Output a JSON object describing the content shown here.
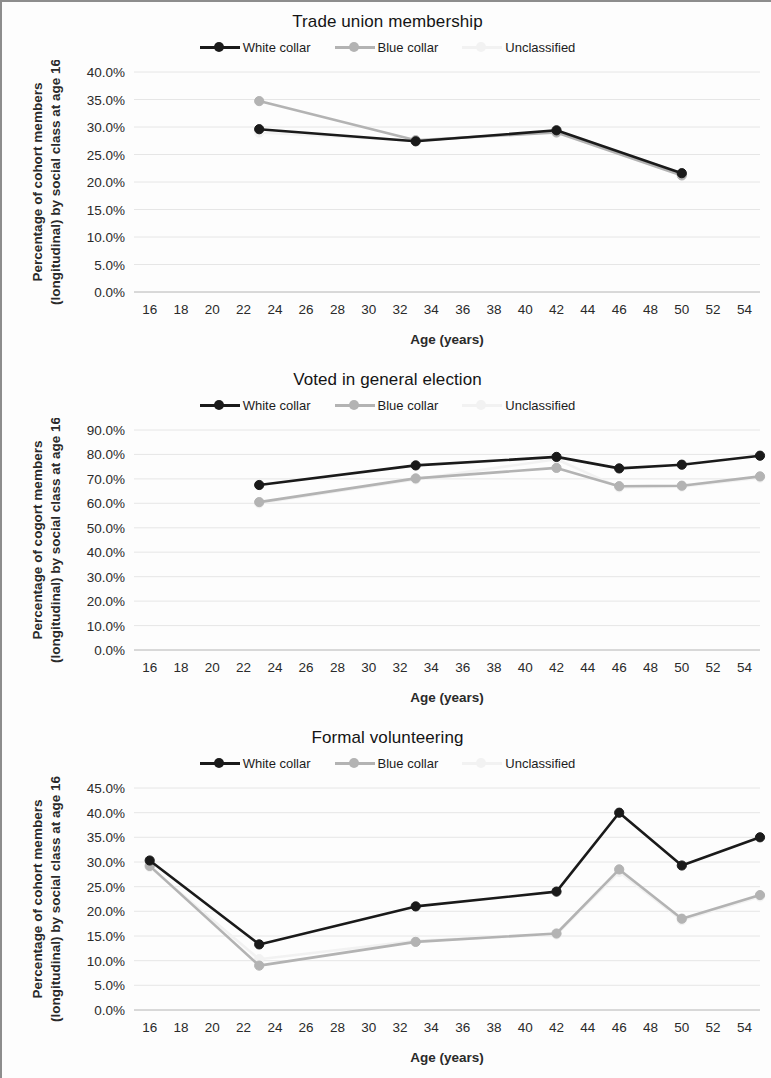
{
  "figure": {
    "axis_x_label": "Age (years)",
    "series_colors": {
      "white_collar": "#1a1a1a",
      "blue_collar": "#b3b3b3",
      "unclassified": "#f2f2f2"
    },
    "gridline_color": "#e6e6e6",
    "axis_line_color": "#bfbfbf"
  },
  "charts": [
    {
      "title": "Trade union membership",
      "ylabel_line1": "Percentage of cohort members",
      "ylabel_line2": "(longitudinal) by social class at age 16",
      "xlabel": "Age (years)",
      "legend": [
        {
          "label": "White collar",
          "color": "#1a1a1a",
          "marker": true
        },
        {
          "label": "Blue collar",
          "color": "#b3b3b3",
          "marker": true
        },
        {
          "label": "Unclassified",
          "color": "#f2f2f2",
          "marker": true
        }
      ],
      "chart_data": {
        "type": "line",
        "title": "Trade union membership",
        "xlabel": "Age (years)",
        "ylabel": "Percentage of cohort members (longitudinal) by social class at age 16",
        "xlim": [
          15,
          55
        ],
        "ylim": [
          0,
          40
        ],
        "xticks": [
          16,
          18,
          20,
          22,
          24,
          26,
          28,
          30,
          32,
          34,
          36,
          38,
          40,
          42,
          44,
          46,
          48,
          50,
          52,
          54
        ],
        "yticks": [
          0,
          5,
          10,
          15,
          20,
          25,
          30,
          35,
          40
        ],
        "ytick_labels": [
          "0.0%",
          "5.0%",
          "10.0%",
          "15.0%",
          "20.0%",
          "25.0%",
          "30.0%",
          "35.0%",
          "40.0%"
        ],
        "grid": true,
        "legend_position": "top",
        "series": [
          {
            "name": "White collar",
            "color": "#1a1a1a",
            "x": [
              23,
              33,
              42,
              50
            ],
            "values": [
              29.6,
              27.4,
              29.4,
              21.6
            ]
          },
          {
            "name": "Blue collar",
            "color": "#b3b3b3",
            "x": [
              23,
              33,
              42,
              50
            ],
            "values": [
              34.7,
              27.6,
              29.0,
              21.2
            ]
          },
          {
            "name": "Unclassified",
            "color": "#f2f2f2",
            "x": [
              23,
              33,
              42,
              50
            ],
            "values": [
              29.0,
              27.5,
              29.2,
              21.4
            ]
          }
        ]
      }
    },
    {
      "title": "Voted in general election",
      "ylabel_line1": "Percentage of cogort members",
      "ylabel_line2": "(longitudinal) by social class at age 16",
      "xlabel": "Age (years)",
      "legend": [
        {
          "label": "White collar",
          "color": "#1a1a1a",
          "marker": true
        },
        {
          "label": "Blue collar",
          "color": "#b3b3b3",
          "marker": true
        },
        {
          "label": "Unclassified",
          "color": "#f2f2f2",
          "marker": true
        }
      ],
      "chart_data": {
        "type": "line",
        "title": "Voted in general election",
        "xlabel": "Age (years)",
        "ylabel": "Percentage of cogort members (longitudinal) by social class at age 16",
        "xlim": [
          15,
          55
        ],
        "ylim": [
          0,
          90
        ],
        "xticks": [
          16,
          18,
          20,
          22,
          24,
          26,
          28,
          30,
          32,
          34,
          36,
          38,
          40,
          42,
          44,
          46,
          48,
          50,
          52,
          54
        ],
        "yticks": [
          0,
          10,
          20,
          30,
          40,
          50,
          60,
          70,
          80,
          90
        ],
        "ytick_labels": [
          "0.0%",
          "10.0%",
          "20.0%",
          "30.0%",
          "40.0%",
          "50.0%",
          "60.0%",
          "70.0%",
          "80.0%",
          "90.0%"
        ],
        "grid": true,
        "legend_position": "top",
        "series": [
          {
            "name": "White collar",
            "color": "#1a1a1a",
            "x": [
              23,
              33,
              42,
              46,
              50,
              55
            ],
            "values": [
              67.5,
              75.5,
              79.0,
              74.3,
              75.8,
              79.5
            ]
          },
          {
            "name": "Blue collar",
            "color": "#b3b3b3",
            "x": [
              23,
              33,
              42,
              46,
              50,
              55
            ],
            "values": [
              60.5,
              70.2,
              74.5,
              67.0,
              67.2,
              71.0
            ]
          },
          {
            "name": "Unclassified",
            "color": "#f2f2f2",
            "x": [
              23,
              33,
              42,
              46,
              50,
              55
            ],
            "values": [
              60.0,
              69.8,
              78.0,
              66.5,
              66.8,
              70.5
            ]
          }
        ]
      }
    },
    {
      "title": "Formal volunteering",
      "ylabel_line1": "Percentage of cohort members",
      "ylabel_line2": "(longitudinal) by social class at age 16",
      "xlabel": "Age (years)",
      "legend": [
        {
          "label": "White collar",
          "color": "#1a1a1a",
          "marker": true
        },
        {
          "label": "Blue collar",
          "color": "#b3b3b3",
          "marker": true
        },
        {
          "label": "Unclassified",
          "color": "#f2f2f2",
          "marker": true
        }
      ],
      "chart_data": {
        "type": "line",
        "title": "Formal volunteering",
        "xlabel": "Age (years)",
        "ylabel": "Percentage of cohort members (longitudinal) by social class at age 16",
        "xlim": [
          15,
          55
        ],
        "ylim": [
          0,
          45
        ],
        "xticks": [
          16,
          18,
          20,
          22,
          24,
          26,
          28,
          30,
          32,
          34,
          36,
          38,
          40,
          42,
          44,
          46,
          48,
          50,
          52,
          54
        ],
        "yticks": [
          0,
          5,
          10,
          15,
          20,
          25,
          30,
          35,
          40,
          45
        ],
        "ytick_labels": [
          "0.0%",
          "5.0%",
          "10.0%",
          "15.0%",
          "20.0%",
          "25.0%",
          "30.0%",
          "35.0%",
          "40.0%",
          "45.0%"
        ],
        "grid": true,
        "legend_position": "top",
        "series": [
          {
            "name": "White collar",
            "color": "#1a1a1a",
            "x": [
              16,
              23,
              33,
              42,
              46,
              50,
              55
            ],
            "values": [
              30.3,
              13.3,
              21.0,
              24.0,
              40.0,
              29.3,
              35.0
            ]
          },
          {
            "name": "Blue collar",
            "color": "#b3b3b3",
            "x": [
              16,
              23,
              33,
              42,
              46,
              50,
              55
            ],
            "values": [
              29.2,
              9.0,
              13.8,
              15.5,
              28.5,
              18.5,
              23.3
            ]
          },
          {
            "name": "Unclassified",
            "color": "#f2f2f2",
            "x": [
              16,
              23,
              33,
              42,
              46,
              50,
              55
            ],
            "values": [
              29.0,
              10.3,
              14.0,
              15.3,
              28.0,
              18.2,
              23.0
            ]
          }
        ]
      }
    }
  ]
}
